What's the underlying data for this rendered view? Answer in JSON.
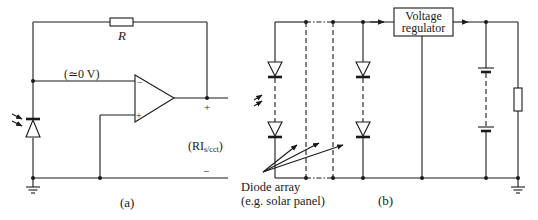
{
  "figure": {
    "panel_a": {
      "caption": "(a)",
      "resistor_label": "R",
      "virtual_ground_label": "(≃0 V)",
      "output_plus": "+",
      "output_minus": "−",
      "output_label_main": "(RI",
      "output_label_sub": "s/cct",
      "output_label_close": ")",
      "opamp_inverting": "−",
      "opamp_noninverting": "+"
    },
    "panel_b": {
      "caption": "(b)",
      "regulator_line1": "Voltage",
      "regulator_line2": "regulator",
      "array_label_line1": "Diode array",
      "array_label_line2": "(e.g. solar panel)"
    },
    "colors": {
      "ink": "#1a1a1a",
      "background": "#ffffff"
    }
  }
}
